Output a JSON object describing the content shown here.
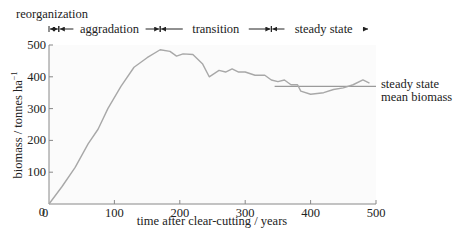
{
  "chart_data": {
    "type": "line",
    "title": "",
    "xlabel": "time after clear-cutting / years",
    "ylabel": "biomass / tonnes ha⁻¹",
    "xlim": [
      0,
      500
    ],
    "ylim": [
      0,
      500
    ],
    "x_ticks": [
      0,
      100,
      200,
      300,
      400,
      500
    ],
    "y_ticks": [
      0,
      100,
      200,
      300,
      400,
      500
    ],
    "x_tick_labels": [
      "0",
      "100",
      "200",
      "300",
      "400",
      "500"
    ],
    "y_tick_labels": [
      "0",
      "100",
      "200",
      "300",
      "400",
      "500"
    ],
    "grid": false,
    "legend": null,
    "series": [
      {
        "name": "biomass",
        "color": "#a8a8a8",
        "x": [
          0,
          20,
          40,
          60,
          75,
          90,
          110,
          130,
          150,
          170,
          185,
          195,
          205,
          220,
          235,
          245,
          260,
          270,
          280,
          290,
          300,
          315,
          330,
          340,
          350,
          360,
          370,
          380,
          385,
          400,
          420,
          435,
          450,
          465,
          480,
          490
        ],
        "y": [
          0,
          55,
          115,
          190,
          235,
          300,
          370,
          430,
          460,
          485,
          480,
          465,
          472,
          470,
          440,
          400,
          420,
          415,
          425,
          415,
          415,
          405,
          405,
          390,
          385,
          390,
          375,
          375,
          355,
          345,
          350,
          360,
          365,
          375,
          390,
          380
        ]
      }
    ],
    "reference_lines": [
      {
        "name": "steady state mean biomass",
        "y": 370,
        "x_start": 345,
        "x_end": 500,
        "color": "#9a9a9a"
      }
    ],
    "phases": [
      {
        "label": "reorganization",
        "start": 0,
        "end": 15
      },
      {
        "label": "aggradation",
        "start": 15,
        "end": 170
      },
      {
        "label": "transition",
        "start": 170,
        "end": 340
      },
      {
        "label": "steady state",
        "start": 340,
        "end": 500
      }
    ],
    "annotations": [
      {
        "text": "steady state",
        "line": 1
      },
      {
        "text": "mean biomass",
        "line": 2
      }
    ]
  },
  "labels": {
    "phase_reorganization": "reorganization",
    "phase_aggradation": "aggradation",
    "phase_transition": "transition",
    "phase_steady": "steady state",
    "annot_line1": "steady state",
    "annot_line2": "mean biomass",
    "xlabel": "time after clear-cutting / years",
    "ylabel_main": "biomass / tonnes ha",
    "ylabel_sup": "−1"
  }
}
